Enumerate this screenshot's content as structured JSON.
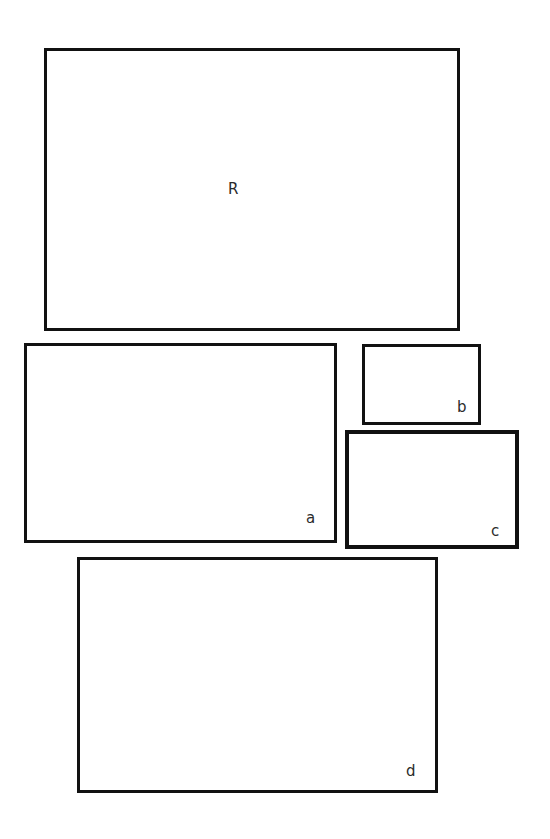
{
  "figure": {
    "background_color": "#ffffff",
    "stroke_color": "#111111",
    "label_color": "#2b2b2b",
    "width": 550,
    "height": 839
  },
  "shapes": [
    {
      "id": "R",
      "kind": "rectangle",
      "label": "R",
      "label_position": "center",
      "x": 44,
      "y": 48,
      "width": 416,
      "height": 283,
      "stroke_width": 3,
      "fill": "none"
    },
    {
      "id": "a",
      "kind": "rectangle",
      "label": "a",
      "label_position": "bottom-right",
      "x": 24,
      "y": 343,
      "width": 313,
      "height": 200,
      "stroke_width": 3,
      "fill": "none"
    },
    {
      "id": "b",
      "kind": "rectangle",
      "label": "b",
      "label_position": "bottom-right",
      "x": 362,
      "y": 344,
      "width": 119,
      "height": 81,
      "stroke_width": 3,
      "fill": "none"
    },
    {
      "id": "c",
      "kind": "rectangle",
      "label": "c",
      "label_position": "bottom-right",
      "x": 345,
      "y": 430,
      "width": 174,
      "height": 119,
      "stroke_width": 4,
      "fill": "none"
    },
    {
      "id": "d",
      "kind": "rectangle",
      "label": "d",
      "label_position": "bottom-right",
      "x": 77,
      "y": 557,
      "width": 361,
      "height": 236,
      "stroke_width": 3,
      "fill": "none"
    }
  ]
}
